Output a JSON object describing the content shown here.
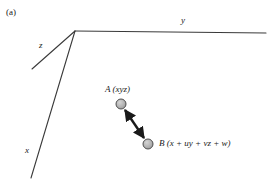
{
  "figure": {
    "panel_caption": "(a)",
    "background_color": "#ffffff",
    "width": 271,
    "height": 187
  },
  "axes": {
    "line_color": "#3a3a3a",
    "origin": {
      "x": 75,
      "y": 31
    },
    "items": [
      {
        "name": "y-axis",
        "label": "y",
        "from": {
          "x": 75,
          "y": 31
        },
        "to": {
          "x": 266,
          "y": 33
        },
        "label_pos": {
          "x": 181,
          "y": 16
        }
      },
      {
        "name": "z-axis",
        "label": "z",
        "from": {
          "x": 75,
          "y": 31
        },
        "to": {
          "x": 32,
          "y": 69
        },
        "label_pos": {
          "x": 39,
          "y": 41
        }
      },
      {
        "name": "x-axis",
        "label": "x",
        "from": {
          "x": 75,
          "y": 31
        },
        "to": {
          "x": 31,
          "y": 178
        },
        "label_pos": {
          "x": 25,
          "y": 146
        }
      }
    ]
  },
  "points": {
    "fill_color": "#b3b3b3",
    "stroke_color": "#4d4d4d",
    "radius": 5,
    "items": [
      {
        "name": "point-a",
        "label": "A (xyz)",
        "center": {
          "x": 121,
          "y": 104
        },
        "label_pos": {
          "x": 105,
          "y": 85
        }
      },
      {
        "name": "point-b",
        "label": "B (x + uy + vz + w)",
        "center": {
          "x": 148,
          "y": 144
        },
        "label_pos": {
          "x": 159,
          "y": 139
        }
      }
    ]
  },
  "connector": {
    "name": "double-headed-arrow",
    "color": "#1a1a1a",
    "from": {
      "x": 121,
      "y": 104
    },
    "to": {
      "x": 148,
      "y": 144
    },
    "arrowheads": "both"
  }
}
